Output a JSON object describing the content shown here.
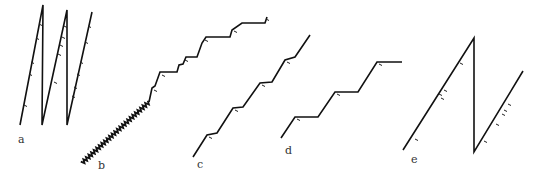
{
  "diagram": {
    "width": 540,
    "height": 180,
    "stroke_color": "#111111",
    "background": "#ffffff",
    "panels": [
      {
        "id": "a",
        "label": "a",
        "label_pos": [
          18,
          143
        ],
        "description": "sawtooth: three steep rising segments with vertical drops",
        "points": [
          [
            20,
            125
          ],
          [
            43,
            5
          ],
          [
            42,
            125
          ],
          [
            67,
            10
          ],
          [
            67,
            125
          ],
          [
            92,
            12
          ]
        ],
        "ticks": [
          [
            39,
            24
          ],
          [
            36,
            38
          ],
          [
            31,
            62
          ],
          [
            29,
            74
          ],
          [
            24,
            105
          ],
          [
            64,
            26
          ],
          [
            62,
            37
          ],
          [
            60,
            45
          ],
          [
            58,
            54
          ],
          [
            54,
            82
          ],
          [
            88,
            26
          ],
          [
            85,
            42
          ],
          [
            80,
            62
          ],
          [
            77,
            74
          ],
          [
            74,
            87
          ],
          [
            72,
            96
          ]
        ]
      },
      {
        "id": "b",
        "label": "b",
        "label_pos": [
          98,
          169
        ],
        "description": "finely serrated ramp followed by irregular staircase",
        "serrated_from": [
          82,
          163
        ],
        "serrated_to": [
          149,
          102
        ],
        "serration_count": 26,
        "points": [
          [
            149,
            102
          ],
          [
            152,
            88
          ],
          [
            155,
            86
          ],
          [
            160,
            72
          ],
          [
            177,
            72
          ],
          [
            179,
            65
          ],
          [
            183,
            64
          ],
          [
            186,
            57
          ],
          [
            197,
            57
          ],
          [
            202,
            43
          ],
          [
            206,
            37
          ],
          [
            230,
            37
          ],
          [
            232,
            30
          ],
          [
            242,
            23
          ],
          [
            265,
            23
          ],
          [
            267,
            17
          ]
        ],
        "ticks": [
          [
            154,
            90
          ],
          [
            162,
            75
          ],
          [
            185,
            60
          ],
          [
            205,
            40
          ],
          [
            234,
            31
          ],
          [
            266,
            19
          ]
        ]
      },
      {
        "id": "c",
        "label": "c",
        "label_pos": [
          197,
          168
        ],
        "description": "smooth wavy staircase",
        "points": [
          [
            193,
            157
          ],
          [
            207,
            135
          ],
          [
            217,
            133
          ],
          [
            233,
            108
          ],
          [
            243,
            107
          ],
          [
            260,
            83
          ],
          [
            272,
            82
          ],
          [
            285,
            60
          ],
          [
            295,
            57
          ],
          [
            310,
            35
          ]
        ],
        "ticks": [
          [
            209,
            137
          ],
          [
            235,
            110
          ],
          [
            262,
            85
          ],
          [
            287,
            62
          ]
        ]
      },
      {
        "id": "d",
        "label": "d",
        "label_pos": [
          285,
          154
        ],
        "description": "regular angular staircase",
        "points": [
          [
            281,
            138
          ],
          [
            295,
            117
          ],
          [
            318,
            117
          ],
          [
            335,
            92
          ],
          [
            358,
            92
          ],
          [
            377,
            62
          ],
          [
            402,
            62
          ]
        ],
        "ticks": [
          [
            297,
            119
          ],
          [
            337,
            94
          ],
          [
            379,
            64
          ]
        ]
      },
      {
        "id": "e",
        "label": "e",
        "label_pos": [
          411,
          163
        ],
        "description": "single long rise, vertical drop, partial rise",
        "points": [
          [
            403,
            150
          ],
          [
            474,
            38
          ],
          [
            474,
            152
          ],
          [
            523,
            71
          ]
        ],
        "ticks": [
          [
            415,
            139
          ],
          [
            439,
            94
          ],
          [
            441,
            98
          ],
          [
            444,
            90
          ],
          [
            460,
            63
          ],
          [
            484,
            141
          ],
          [
            496,
            124
          ],
          [
            502,
            114
          ],
          [
            504,
            110
          ],
          [
            508,
            104
          ]
        ]
      }
    ]
  }
}
